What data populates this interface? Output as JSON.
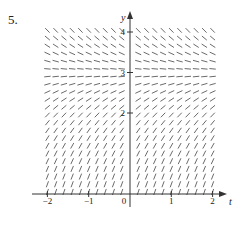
{
  "figure": {
    "problem_number": "5.",
    "x_axis_label": "t",
    "y_axis_label": "y",
    "x_ticks": [
      {
        "value": -2,
        "label": "−2"
      },
      {
        "value": -1,
        "label": "−1"
      },
      {
        "value": 0,
        "label": "0"
      },
      {
        "value": 1,
        "label": "1"
      },
      {
        "value": 2,
        "label": "2"
      }
    ],
    "y_ticks": [
      {
        "value": 2,
        "label": "2"
      },
      {
        "value": 3,
        "label": "3"
      },
      {
        "value": 4,
        "label": "4"
      }
    ],
    "slope_field": {
      "description": "Slope field depending only on y; horizontal segments at equilibrium y = 3, negative slopes above, positive (steepening) slopes below",
      "equilibrium_y": 3,
      "t_range": [
        -2,
        2
      ],
      "y_range": [
        0,
        4.2
      ],
      "t_step": 0.2,
      "y_step": 0.19
    },
    "colors": {
      "axis": "#333333",
      "segment": "#444444"
    }
  }
}
